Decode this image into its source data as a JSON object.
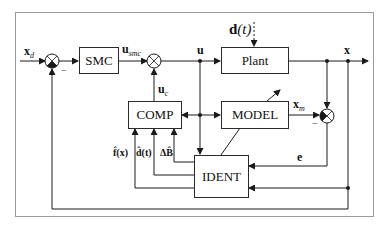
{
  "diagram": {
    "type": "control-block-diagram",
    "blocks": [
      {
        "id": "smc",
        "label": "SMC"
      },
      {
        "id": "plant",
        "label": "Plant"
      },
      {
        "id": "comp",
        "label": "COMP"
      },
      {
        "id": "model",
        "label": "MODEL"
      },
      {
        "id": "ident",
        "label": "IDENT"
      }
    ],
    "signals": {
      "xd": {
        "main": "x",
        "sub": "d"
      },
      "usmc": {
        "main": "u",
        "sub": "smc"
      },
      "uc": {
        "main": "u",
        "sub": "c"
      },
      "u": {
        "main": "u"
      },
      "dt": {
        "main": "d",
        "arg": "(t)"
      },
      "x": {
        "main": "x"
      },
      "xm": {
        "main": "x",
        "sub": "m"
      },
      "e": {
        "main": "e"
      },
      "fhat": "f̂(x)",
      "dhat": "d̂(t)",
      "dbhat": "ΔB̂"
    },
    "signs": {
      "sum1_minus": "−",
      "sum3_minus": "−"
    },
    "colors": {
      "line": "#1a1a1a",
      "frame": "#9a9a9a",
      "background": "#ffffff"
    }
  }
}
